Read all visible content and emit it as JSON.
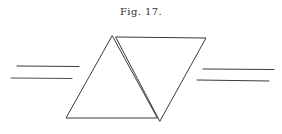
{
  "figure": {
    "caption": "Fig. 17.",
    "stroke_color": "#3a3a3a",
    "background": "#ffffff"
  }
}
